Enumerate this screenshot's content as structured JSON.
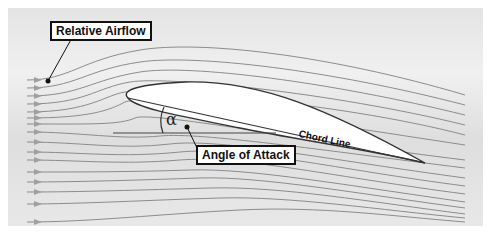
{
  "diagram": {
    "labels": {
      "relative_airflow": "Relative Airflow",
      "angle_of_attack": "Angle of Attack",
      "chord_line": "Chord Line",
      "alpha_symbol": "α"
    },
    "colors": {
      "background_panel": "#e6e6e6",
      "streamline": "#8c8c8c",
      "airfoil_fill": "#ffffff",
      "outline": "#333333",
      "label_border": "#111111"
    },
    "streamline_count": 16
  }
}
